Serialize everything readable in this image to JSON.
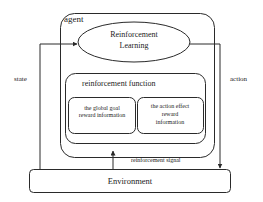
{
  "diagram": {
    "agent_label": "agent",
    "rl_node": {
      "line1": "Reinforcement",
      "line2": "Learning"
    },
    "reinforcement_function": {
      "title": "reinforcement function",
      "left_box": {
        "line1": "the global goal",
        "line2": "reward information"
      },
      "right_box": {
        "line1": "the action effect",
        "line2": "reward",
        "line3": "information"
      }
    },
    "environment_label": "Environment",
    "edges": {
      "state": "state",
      "action": "action",
      "reinforcement_signal": "reinforcement signal"
    },
    "colors": {
      "stroke": "#2a2a2a",
      "background": "#ffffff",
      "text": "#222222"
    }
  }
}
